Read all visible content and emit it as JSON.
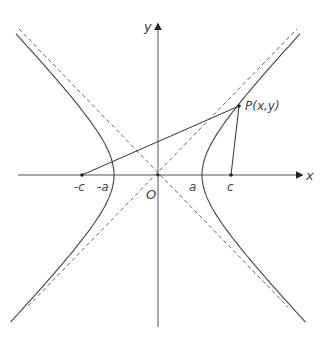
{
  "diagram": {
    "type": "hyperbola-with-foci",
    "colors": {
      "curve": "#444444",
      "axis": "#555555",
      "asymptote": "#666666",
      "background": "#ffffff"
    },
    "labels": {
      "x_axis": "x",
      "y_axis": "y",
      "origin": "O",
      "neg_c": "-c",
      "neg_a": "-a",
      "pos_a": "a",
      "pos_c": "c",
      "point": "P(x,y)"
    },
    "geometry": {
      "origin_px": [
        158,
        175
      ],
      "a_px": 44,
      "b_px": 46,
      "focus_left_px": [
        82,
        175
      ],
      "focus_right_px": [
        231,
        175
      ],
      "point_P_px": [
        239,
        106
      ]
    }
  }
}
